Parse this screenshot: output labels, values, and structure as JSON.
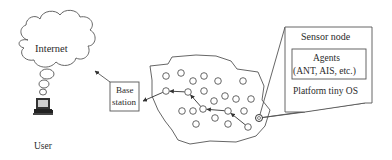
{
  "diagram": {
    "internet_label": "Internet",
    "user_label": "User",
    "base_station_line1": "Base",
    "base_station_line2": "station",
    "sensor_node": {
      "title": "Sensor node",
      "agents_line1": "Agents",
      "agents_line2": "(ANT, AIS, etc.)",
      "platform": "Platform tiny OS"
    },
    "colors": {
      "stroke": "#555555",
      "text": "#2a2a2a",
      "background": "#ffffff"
    },
    "nodes": [
      [
        166,
        76
      ],
      [
        181,
        73
      ],
      [
        193,
        81
      ],
      [
        204,
        76
      ],
      [
        218,
        81
      ],
      [
        243,
        81
      ],
      [
        166,
        91
      ],
      [
        188,
        92
      ],
      [
        204,
        91
      ],
      [
        225,
        96
      ],
      [
        236,
        99
      ],
      [
        251,
        99
      ],
      [
        214,
        101
      ],
      [
        182,
        111
      ],
      [
        193,
        111
      ],
      [
        203,
        109
      ],
      [
        228,
        111
      ],
      [
        244,
        111
      ],
      [
        215,
        118
      ],
      [
        196,
        124
      ],
      [
        228,
        124
      ],
      [
        248,
        127
      ],
      [
        259,
        118
      ]
    ],
    "routing_path": [
      [
        248,
        127
      ],
      [
        228,
        111
      ],
      [
        203,
        109
      ],
      [
        188,
        92
      ],
      [
        166,
        91
      ],
      [
        143,
        101
      ]
    ],
    "highlighted_node": [
      259,
      118
    ]
  }
}
